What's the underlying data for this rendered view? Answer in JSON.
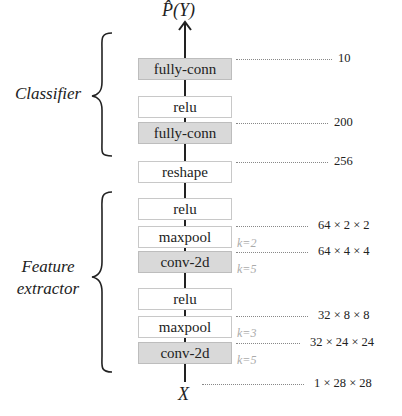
{
  "output_label": "P̂(Y)",
  "input_label": "X",
  "groups": {
    "classifier": "Classifier",
    "feature_extractor_line1": "Feature",
    "feature_extractor_line2": "extractor"
  },
  "layers": [
    {
      "label": "fully-conn",
      "shaded": true
    },
    {
      "label": "relu",
      "shaded": false
    },
    {
      "label": "fully-conn",
      "shaded": true
    },
    {
      "label": "reshape",
      "shaded": false
    },
    {
      "label": "relu",
      "shaded": false
    },
    {
      "label": "maxpool",
      "shaded": false
    },
    {
      "label": "conv-2d",
      "shaded": true
    },
    {
      "label": "relu",
      "shaded": false
    },
    {
      "label": "maxpool",
      "shaded": false
    },
    {
      "label": "conv-2d",
      "shaded": true
    }
  ],
  "dimensions": [
    "10",
    "200",
    "256",
    "64 × 2 × 2",
    "64 × 4 × 4",
    "32 × 8 × 8",
    "32 × 24 × 24",
    "1 × 28 × 28"
  ],
  "kernel_labels": [
    "k=2",
    "k=5",
    "k=3",
    "k=5"
  ]
}
